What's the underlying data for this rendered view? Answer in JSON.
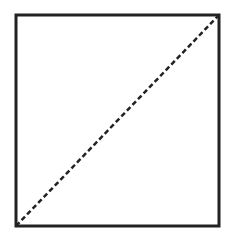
{
  "diagram": {
    "type": "square-with-diagonal",
    "square": {
      "x": 16,
      "y": 15,
      "width": 203,
      "height": 211,
      "stroke": "#222222",
      "stroke_width": 3
    },
    "diagonal": {
      "from": "bottom-left",
      "to": "top-right",
      "x1": 16,
      "y1": 226,
      "x2": 219,
      "y2": 15,
      "stroke": "#222222",
      "stroke_width": 2.5,
      "dash_pattern": "5 3"
    }
  }
}
